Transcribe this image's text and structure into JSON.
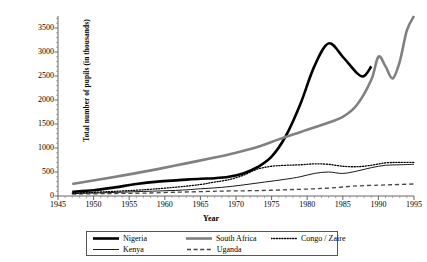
{
  "chart_data": {
    "type": "line",
    "title": "",
    "xlabel": "Year",
    "ylabel": "Total number of pupils (in thousands)",
    "xlim": [
      1945,
      1995
    ],
    "ylim": [
      0,
      3750
    ],
    "xticks": [
      "1945",
      "1950",
      "1955",
      "1960",
      "1965",
      "1970",
      "1975",
      "1980",
      "1985",
      "1990",
      "1995"
    ],
    "yticks": [
      "0",
      "500",
      "1000",
      "1500",
      "2000",
      "2500",
      "3000",
      "3500"
    ],
    "grid": false,
    "legend_position": "bottom",
    "series": [
      {
        "name": "Nigeria",
        "style": "solid",
        "color": "#000000",
        "width": 2.6,
        "x": [
          1947,
          1950,
          1953,
          1956,
          1959,
          1962,
          1965,
          1967,
          1969,
          1971,
          1973,
          1975,
          1977,
          1979,
          1981,
          1983,
          1985,
          1987,
          1988,
          1989
        ],
        "y": [
          90,
          120,
          180,
          250,
          300,
          330,
          360,
          370,
          400,
          470,
          600,
          820,
          1250,
          1900,
          2700,
          3180,
          2900,
          2560,
          2500,
          2700
        ]
      },
      {
        "name": "Kenya",
        "style": "solid",
        "color": "#000000",
        "width": 0.9,
        "x": [
          1947,
          1952,
          1957,
          1962,
          1965,
          1968,
          1971,
          1974,
          1977,
          1979,
          1981,
          1983,
          1985,
          1987,
          1989,
          1991,
          1993,
          1995
        ],
        "y": [
          50,
          70,
          95,
          120,
          150,
          180,
          230,
          290,
          350,
          400,
          470,
          500,
          470,
          520,
          590,
          640,
          650,
          660
        ]
      },
      {
        "name": "South Africa",
        "style": "solid",
        "color": "#808080",
        "width": 2.6,
        "x": [
          1947,
          1951,
          1955,
          1959,
          1963,
          1967,
          1970,
          1973,
          1976,
          1979,
          1982,
          1985,
          1987,
          1989,
          1990,
          1991,
          1992,
          1993,
          1994,
          1995
        ],
        "y": [
          250,
          350,
          450,
          560,
          680,
          800,
          900,
          1020,
          1180,
          1330,
          1480,
          1650,
          1900,
          2420,
          2900,
          2700,
          2450,
          2800,
          3450,
          3750
        ]
      },
      {
        "name": "Uganda",
        "style": "dashed",
        "color": "#444444",
        "width": 1.3,
        "x": [
          1947,
          1952,
          1957,
          1962,
          1966,
          1969,
          1972,
          1975,
          1978,
          1981,
          1984,
          1987,
          1990,
          1992,
          1995
        ],
        "y": [
          40,
          50,
          60,
          80,
          95,
          105,
          110,
          120,
          135,
          150,
          175,
          210,
          225,
          235,
          250
        ]
      },
      {
        "name": "Congo / Zaire",
        "style": "dotted",
        "color": "#000000",
        "width": 1.3,
        "x": [
          1947,
          1952,
          1957,
          1962,
          1965,
          1967,
          1969,
          1971,
          1973,
          1975,
          1977,
          1979,
          1981,
          1983,
          1985,
          1987,
          1989,
          1991,
          1993,
          1995
        ],
        "y": [
          60,
          90,
          130,
          190,
          240,
          290,
          340,
          430,
          560,
          620,
          640,
          650,
          670,
          660,
          620,
          610,
          640,
          690,
          700,
          700
        ]
      }
    ]
  },
  "legend": {
    "items": [
      {
        "label": "Nigeria",
        "style": "solid-thick-black"
      },
      {
        "label": "South Africa",
        "style": "solid-thick-gray"
      },
      {
        "label": "Congo / Zaire",
        "style": "dotted-black"
      },
      {
        "label": "Kenya",
        "style": "solid-thin-black"
      },
      {
        "label": "Uganda",
        "style": "dashed-gray"
      }
    ]
  },
  "artifact": {
    "top_text": ""
  }
}
